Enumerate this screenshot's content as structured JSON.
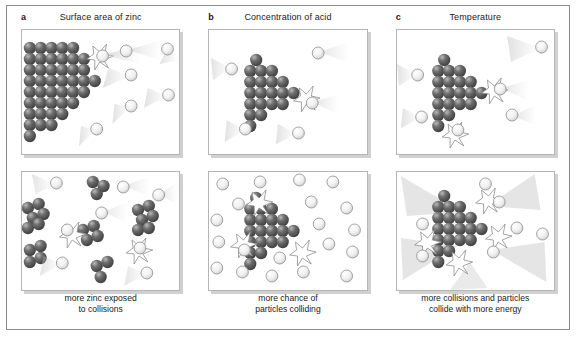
{
  "figure": {
    "title_bar": "",
    "columns": [
      {
        "letter": "a",
        "title": "Surface area of zinc",
        "caption_line1": "more zinc exposed",
        "caption_line2": "to collisions"
      },
      {
        "letter": "b",
        "title": "Concentration of acid",
        "caption_line1": "more chance of",
        "caption_line2": "particles colliding"
      },
      {
        "letter": "c",
        "title": "Temperature",
        "caption_line1": "more collisions and particles",
        "caption_line2": "collide with more energy"
      }
    ]
  },
  "legend_semantics": {
    "dark_sphere": "zinc-particle",
    "light_sphere": "acid-particle",
    "starburst": "collision-flash",
    "trail": "motion-trail"
  },
  "colors": {
    "zinc_dark": "#4a4a4a",
    "zinc_mid": "#6e6e6e",
    "zinc_light": "#9a9a9a",
    "acid_fill": "#f2f2f2",
    "acid_stroke": "#8e8e8e",
    "trail": "#d9d9d9",
    "panel_border": "#b5b5b5",
    "figure_border": "#8d8d8d",
    "text": "#1a1a1a"
  },
  "scenes": {
    "a_top": {
      "zinc_rows": [
        9,
        8,
        7,
        6,
        5,
        4,
        3,
        2,
        1
      ],
      "zinc_count": 45,
      "acid_count": 6,
      "collision_count": 1,
      "description": "one large solid block of zinc, few acid particles"
    },
    "a_bottom": {
      "zinc_clusters": 6,
      "zinc_count": 26,
      "acid_count": 8,
      "collision_count": 2,
      "description": "zinc broken into small lumps, more exposed surface"
    },
    "b_top": {
      "zinc_rows": [
        5,
        5,
        4,
        3,
        2,
        1
      ],
      "zinc_count": 20,
      "acid_count": 5,
      "collision_count": 1,
      "description": "zinc block with dilute acid"
    },
    "b_bottom": {
      "zinc_rows": [
        5,
        5,
        4,
        3,
        2,
        1
      ],
      "zinc_count": 20,
      "acid_count": 20,
      "collision_count": 3,
      "description": "zinc block with concentrated acid"
    },
    "c_top": {
      "zinc_rows": [
        5,
        5,
        4,
        3,
        2,
        1
      ],
      "zinc_count": 20,
      "acid_count": 5,
      "collision_count": 2,
      "description": "zinc block at low temperature, short motion trails"
    },
    "c_bottom": {
      "zinc_rows": [
        5,
        5,
        4,
        3,
        2,
        1
      ],
      "zinc_count": 20,
      "acid_count": 7,
      "collision_count": 4,
      "description": "zinc block at high temperature, long fast motion trails"
    }
  }
}
